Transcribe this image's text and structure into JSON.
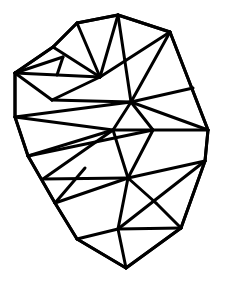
{
  "diagram": {
    "type": "triangulation",
    "stroke_color": "#000000",
    "background_color": "#ffffff",
    "stroke_width": 3,
    "vertices": {
      "A": [
        118,
        15
      ],
      "B": [
        77,
        23
      ],
      "C": [
        170,
        32
      ],
      "D": [
        53,
        47
      ],
      "E": [
        63,
        57
      ],
      "F": [
        15,
        73
      ],
      "G": [
        57,
        75
      ],
      "H": [
        100,
        77
      ],
      "I": [
        193,
        88
      ],
      "J": [
        52,
        100
      ],
      "K": [
        131,
        102
      ],
      "L": [
        15,
        117
      ],
      "M": [
        113,
        130
      ],
      "N": [
        153,
        130
      ],
      "O": [
        208,
        130
      ],
      "P": [
        28,
        156
      ],
      "Q": [
        205,
        161
      ],
      "R": [
        85,
        168
      ],
      "S": [
        128,
        178
      ],
      "T": [
        43,
        179
      ],
      "U": [
        55,
        203
      ],
      "V": [
        156,
        203
      ],
      "W": [
        181,
        228
      ],
      "X": [
        118,
        229
      ],
      "Y": [
        77,
        239
      ],
      "Z": [
        126,
        268
      ]
    },
    "outline": [
      "A",
      "C",
      "O",
      "Q",
      "W",
      "Z",
      "Y",
      "U",
      "P",
      "L",
      "F",
      "D",
      "B"
    ],
    "edges": [
      [
        "A",
        "B"
      ],
      [
        "A",
        "C"
      ],
      [
        "B",
        "D"
      ],
      [
        "D",
        "F"
      ],
      [
        "F",
        "L"
      ],
      [
        "L",
        "P"
      ],
      [
        "P",
        "U"
      ],
      [
        "U",
        "Y"
      ],
      [
        "Y",
        "Z"
      ],
      [
        "Z",
        "W"
      ],
      [
        "W",
        "Q"
      ],
      [
        "Q",
        "O"
      ],
      [
        "O",
        "C"
      ],
      [
        "B",
        "H"
      ],
      [
        "A",
        "K"
      ],
      [
        "A",
        "H"
      ],
      [
        "C",
        "H"
      ],
      [
        "C",
        "K"
      ],
      [
        "K",
        "I"
      ],
      [
        "D",
        "H"
      ],
      [
        "E",
        "F"
      ],
      [
        "E",
        "G"
      ],
      [
        "F",
        "H"
      ],
      [
        "F",
        "J"
      ],
      [
        "J",
        "H"
      ],
      [
        "J",
        "K"
      ],
      [
        "L",
        "K"
      ],
      [
        "L",
        "M"
      ],
      [
        "K",
        "M"
      ],
      [
        "K",
        "N"
      ],
      [
        "K",
        "O"
      ],
      [
        "M",
        "O"
      ],
      [
        "M",
        "P"
      ],
      [
        "P",
        "N"
      ],
      [
        "M",
        "T"
      ],
      [
        "N",
        "S"
      ],
      [
        "M",
        "S"
      ],
      [
        "T",
        "S"
      ],
      [
        "U",
        "S"
      ],
      [
        "S",
        "Q"
      ],
      [
        "S",
        "V"
      ],
      [
        "V",
        "W"
      ],
      [
        "Q",
        "X"
      ],
      [
        "S",
        "X"
      ],
      [
        "X",
        "W"
      ],
      [
        "X",
        "Y"
      ],
      [
        "X",
        "Z"
      ],
      [
        "U",
        "R"
      ]
    ]
  }
}
